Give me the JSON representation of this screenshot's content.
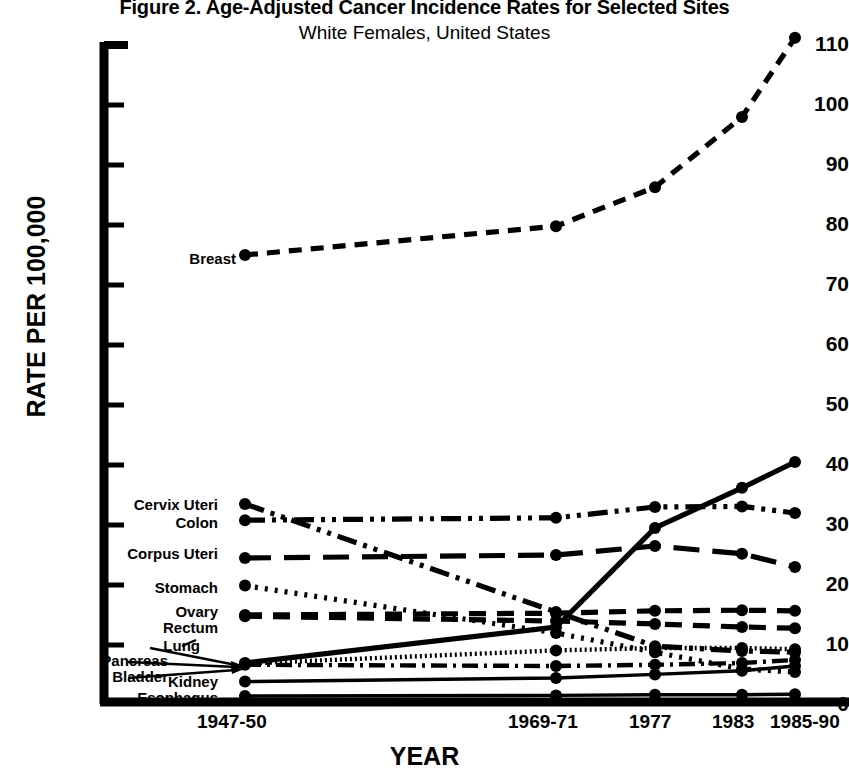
{
  "title": {
    "main": "Figure 2. Age-Adjusted Cancer Incidence Rates for Selected Sites",
    "sub": "White Females, United States"
  },
  "axes": {
    "ylabel": "RATE PER 100,000",
    "xlabel": "YEAR",
    "yticks": [
      "110",
      "100",
      "90",
      "80",
      "70",
      "60",
      "50",
      "40",
      "30",
      "20",
      "10",
      "0"
    ],
    "xticks": [
      "1947-50",
      "1969-71",
      "1977",
      "1983",
      "1985-90"
    ]
  },
  "labels": {
    "breast": "Breast",
    "cervix": "Cervix Uteri",
    "colon": "Colon",
    "corpus": "Corpus Uteri",
    "stomach": "Stomach",
    "ovary": "Ovary",
    "rectum": "Rectum",
    "lung": "Lung",
    "pancreas": "Pancreas",
    "bladder": "Bladder",
    "kidney": "Kidney",
    "esophagus": "Esophagus"
  },
  "chart_data": {
    "type": "line",
    "title": "Figure 2. Age-Adjusted Cancer Incidence Rates for Selected Sites",
    "subtitle": "White Females, United States",
    "xlabel": "YEAR",
    "ylabel": "RATE PER 100,000",
    "categories": [
      "1947-50",
      "1969-71",
      "1977",
      "1983",
      "1985-90"
    ],
    "ylim": [
      0,
      110
    ],
    "ytick_step": 10,
    "grid": false,
    "legend": "inline-left-labels",
    "color": "#000000",
    "series": [
      {
        "name": "Breast",
        "dash": "medium-dash",
        "values": [
          74.5,
          79.3,
          85.8,
          97.5,
          110.7
        ]
      },
      {
        "name": "Cervix Uteri",
        "dash": "dash-dot-dot",
        "values": [
          33.0,
          15.0,
          9.3,
          8.5,
          8.3
        ]
      },
      {
        "name": "Colon",
        "dash": "dash-dot-dot",
        "values": [
          30.3,
          30.7,
          32.5,
          32.6,
          31.5
        ]
      },
      {
        "name": "Corpus Uteri",
        "dash": "long-dash",
        "values": [
          24.0,
          24.5,
          26.0,
          24.7,
          22.5
        ]
      },
      {
        "name": "Stomach",
        "dash": "dotted",
        "values": [
          19.4,
          11.5,
          8.3,
          5.5,
          5.0
        ]
      },
      {
        "name": "Ovary",
        "dash": "dashed",
        "values": [
          14.5,
          14.8,
          15.2,
          15.3,
          15.2
        ]
      },
      {
        "name": "Rectum",
        "dash": "dashed",
        "values": [
          14.3,
          13.5,
          13.0,
          12.5,
          12.3
        ]
      },
      {
        "name": "Lung",
        "dash": "solid",
        "values": [
          6.5,
          12.5,
          29.0,
          35.7,
          40.0
        ]
      },
      {
        "name": "Pancreas",
        "dash": "fine-dot",
        "values": [
          6.4,
          8.6,
          9.0,
          9.0,
          8.8
        ]
      },
      {
        "name": "Bladder",
        "dash": "dash-dot",
        "values": [
          6.2,
          6.0,
          6.2,
          6.5,
          7.0
        ]
      },
      {
        "name": "Kidney",
        "dash": "solid-thin",
        "values": [
          3.4,
          4.0,
          4.6,
          5.2,
          6.0
        ]
      },
      {
        "name": "Esophagus",
        "dash": "solid-thin",
        "values": [
          1.0,
          1.1,
          1.2,
          1.2,
          1.3
        ]
      }
    ]
  }
}
